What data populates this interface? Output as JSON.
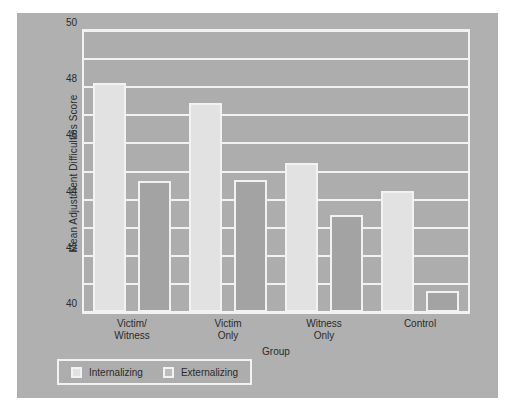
{
  "chart_data": {
    "type": "bar",
    "title": "",
    "xlabel": "Group",
    "ylabel": "Mean Adjustment Difficulties Score",
    "categories": [
      "Victim/\nWitness",
      "Victim\nOnly",
      "Witness\nOnly",
      "Control"
    ],
    "series": [
      {
        "name": "Internalizing",
        "values": [
          56.3,
          54.9,
          50.6,
          48.6
        ],
        "color": "#e2e2e2"
      },
      {
        "name": "Externalizing",
        "values": [
          49.3,
          49.4,
          46.9,
          41.5
        ],
        "color": "#a3a3a3"
      }
    ],
    "ylim": [
      40,
      60
    ],
    "ytick_labels": [
      "40",
      "42",
      "44",
      "46",
      "48",
      "50",
      "52",
      "54",
      "56",
      "58",
      "60"
    ],
    "ytick_values": [
      40,
      42,
      44,
      46,
      48,
      50,
      52,
      54,
      56,
      58,
      60
    ],
    "grid": true,
    "legend_position": "bottom-left",
    "legend_entries": [
      "Internalizing",
      "Externalizing"
    ],
    "background_color": "#adadad",
    "gridline_color": "#f2f2f2"
  }
}
